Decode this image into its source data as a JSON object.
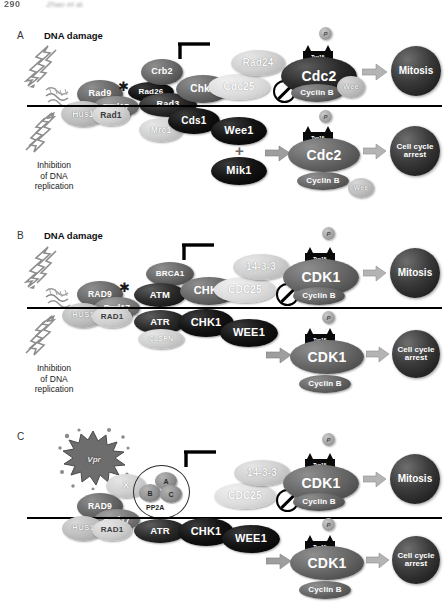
{
  "runhead": {
    "page": "290",
    "authors": "Zhao et al."
  },
  "panels": [
    {
      "id": "A",
      "label": "A",
      "title": "DNA damage",
      "damage_caption": "Inhibition\nof DNA\nreplication",
      "caption_lines": [
        "Inhibition",
        "of DNA",
        "replication"
      ],
      "upper": {
        "sensors": [
          "Rad9",
          "Rad17",
          "Hus1",
          "Rad1"
        ],
        "mediators": [
          "Rad26",
          "Crb2",
          "Rad3"
        ],
        "kinase": "Chk1",
        "phosphatase": "Cdc25",
        "adaptor": "Rad24",
        "cdk": "Cdc2",
        "cyclin": "Cyclin B",
        "wee": "Wee",
        "site": "Tyr15",
        "phospho": "P",
        "outcome": "Mitosis"
      },
      "lower": {
        "mediator": "Mrc1",
        "kinase": "Cds1",
        "wee_kinases": [
          "Wee1",
          "Mik1"
        ],
        "plus": "+",
        "cdk": "Cdc2",
        "cyclin": "Cyclin B",
        "wee": "Wee",
        "site": "Tyr15",
        "phospho": "P",
        "outcome": "Cell cycle\narrest",
        "outcome_lines": [
          "Cell cycle",
          "arrest"
        ]
      }
    },
    {
      "id": "B",
      "label": "B",
      "title": "DNA damage",
      "caption_lines": [
        "Inhibition",
        "of DNA",
        "replication"
      ],
      "upper": {
        "sensors": [
          "RAD9",
          "Rad17",
          "HUS1",
          "RAD1"
        ],
        "mediators": [
          "BRCA1",
          "ATM"
        ],
        "kinase": "CHK2",
        "phosphatase": "CDC25",
        "adaptor": "14-3-3",
        "cdk": "CDK1",
        "cyclin": "Cyclin B",
        "site": "Tyr15",
        "phospho": "P",
        "outcome": "Mitosis"
      },
      "lower": {
        "mediators": [
          "ATR",
          "CLSPN"
        ],
        "kinase": "CHK1",
        "wee_kinase": "WEE1",
        "cdk": "CDK1",
        "cyclin": "Cyclin B",
        "site": "Tyr15",
        "phospho": "P",
        "outcome_lines": [
          "Cell cycle",
          "arrest"
        ]
      }
    },
    {
      "id": "C",
      "label": "C",
      "title": "",
      "virus": "Vpr",
      "unknown_factor": "X",
      "phosphatase_complex": {
        "name": "PP2A",
        "subunits": [
          "A",
          "B",
          "C"
        ]
      },
      "upper": {
        "sensors": [
          "RAD9",
          "Rad17"
        ],
        "adaptor": "14-3-3",
        "phosphatase": "CDC25",
        "cdk": "CDK1",
        "cyclin": "Cyclin B",
        "site": "Tyr15",
        "phospho": "P",
        "outcome": "Mitosis"
      },
      "lower": {
        "sensors": [
          "HUS1",
          "RAD1"
        ],
        "mediator": "ATR",
        "kinase": "CHK1",
        "wee_kinase": "WEE1",
        "cdk": "CDK1",
        "cyclin": "Cyclin B",
        "site": "Tyr15",
        "phospho": "P",
        "outcome_lines": [
          "Cell cycle",
          "arrest"
        ]
      }
    }
  ]
}
